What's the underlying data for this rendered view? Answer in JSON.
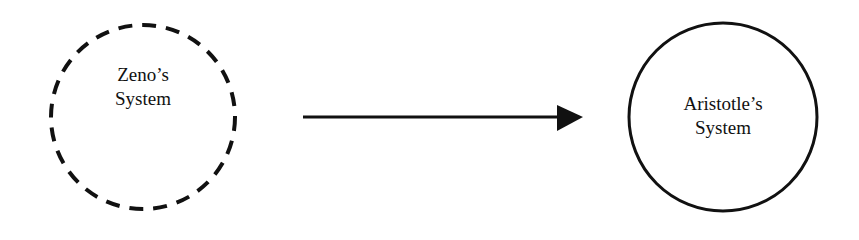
{
  "diagram": {
    "nodes": [
      {
        "id": "zeno",
        "line1": "Zeno’s",
        "line2": "System",
        "border": "dashed"
      },
      {
        "id": "aristotle",
        "line1": "Aristotle’s",
        "line2": "System",
        "border": "solid"
      }
    ],
    "edges": [
      {
        "from": "zeno",
        "to": "aristotle",
        "style": "arrow"
      }
    ],
    "colors": {
      "stroke": "#111111",
      "background": "#ffffff"
    }
  }
}
